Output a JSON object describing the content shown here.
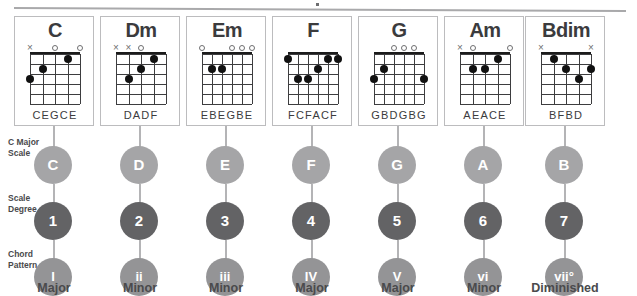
{
  "diagram": {
    "row_labels": {
      "scale": "C Major Scale",
      "degree": "Scale Degree",
      "pattern": "Chord Pattern"
    }
  },
  "chart_data": {
    "type": "table",
    "columns": [
      "Chord",
      "String Notes",
      "Scale Note",
      "Scale Degree",
      "Chord Pattern",
      "Quality"
    ],
    "rows": [
      [
        "C",
        "CEGCE",
        "C",
        "1",
        "I",
        "Major"
      ],
      [
        "Dm",
        "DADF",
        "D",
        "2",
        "ii",
        "Minor"
      ],
      [
        "Em",
        "EBEGBE",
        "E",
        "3",
        "iii",
        "Minor"
      ],
      [
        "F",
        "FCFACF",
        "F",
        "4",
        "IV",
        "Major"
      ],
      [
        "G",
        "GBDGBG",
        "G",
        "5",
        "V",
        "Major"
      ],
      [
        "Am",
        "AEACE",
        "A",
        "6",
        "vi",
        "Minor"
      ],
      [
        "Bdim",
        "BFBD",
        "B",
        "7",
        "vii°",
        "Diminished"
      ]
    ],
    "colors": {
      "scale_circle": "#a5a5a7",
      "degree_circle": "#636365",
      "pattern_circle": "#949496",
      "text": "#58585a",
      "grid": "#3d3d3f",
      "dot": "#111111"
    }
  },
  "chords": [
    {
      "name": "C",
      "string_notes": "CEGCE",
      "strings": 5,
      "frets": 5,
      "markers": [
        "x",
        "",
        "o",
        "",
        "o"
      ],
      "dots": [
        {
          "string": 1,
          "fret": 3
        },
        {
          "string": 2,
          "fret": 2
        },
        {
          "string": 4,
          "fret": 1
        }
      ],
      "scale_note": "C",
      "degree": "1",
      "pattern": "I",
      "quality": "Major"
    },
    {
      "name": "Dm",
      "string_notes": "DADF",
      "strings": 5,
      "frets": 5,
      "markers": [
        "x",
        "x",
        "o",
        "",
        ""
      ],
      "dots": [
        {
          "string": 4,
          "fret": 1
        },
        {
          "string": 3,
          "fret": 2
        },
        {
          "string": 2,
          "fret": 3
        }
      ],
      "scale_note": "D",
      "degree": "2",
      "pattern": "ii",
      "quality": "Minor"
    },
    {
      "name": "Em",
      "string_notes": "EBEGBE",
      "strings": 6,
      "frets": 5,
      "markers": [
        "o",
        "",
        "",
        "o",
        "o",
        "o"
      ],
      "dots": [
        {
          "string": 2,
          "fret": 2
        },
        {
          "string": 3,
          "fret": 2
        }
      ],
      "scale_note": "E",
      "degree": "3",
      "pattern": "iii",
      "quality": "Minor"
    },
    {
      "name": "F",
      "string_notes": "FCFACF",
      "strings": 6,
      "frets": 5,
      "markers": [
        "",
        "",
        "",
        "",
        "",
        ""
      ],
      "dots": [
        {
          "string": 1,
          "fret": 1
        },
        {
          "string": 5,
          "fret": 1
        },
        {
          "string": 6,
          "fret": 1
        },
        {
          "string": 4,
          "fret": 2
        },
        {
          "string": 2,
          "fret": 3
        },
        {
          "string": 3,
          "fret": 3
        }
      ],
      "scale_note": "F",
      "degree": "4",
      "pattern": "IV",
      "quality": "Major"
    },
    {
      "name": "G",
      "string_notes": "GBDGBG",
      "strings": 6,
      "frets": 5,
      "markers": [
        "",
        "",
        "o",
        "o",
        "o",
        ""
      ],
      "dots": [
        {
          "string": 2,
          "fret": 2
        },
        {
          "string": 1,
          "fret": 3
        },
        {
          "string": 6,
          "fret": 3
        }
      ],
      "scale_note": "G",
      "degree": "5",
      "pattern": "V",
      "quality": "Major"
    },
    {
      "name": "Am",
      "string_notes": "AEACE",
      "strings": 5,
      "frets": 5,
      "markers": [
        "x",
        "o",
        "",
        "",
        "o"
      ],
      "dots": [
        {
          "string": 4,
          "fret": 1
        },
        {
          "string": 2,
          "fret": 2
        },
        {
          "string": 3,
          "fret": 2
        }
      ],
      "scale_note": "A",
      "degree": "6",
      "pattern": "vi",
      "quality": "Minor"
    },
    {
      "name": "Bdim",
      "string_notes": "BFBD",
      "strings": 5,
      "frets": 5,
      "markers": [
        "x",
        "",
        "",
        "",
        "x"
      ],
      "dots": [
        {
          "string": 2,
          "fret": 1
        },
        {
          "string": 3,
          "fret": 2
        },
        {
          "string": 5,
          "fret": 2
        },
        {
          "string": 4,
          "fret": 3
        }
      ],
      "scale_note": "B",
      "degree": "7",
      "pattern": "vii°",
      "quality": "Diminished"
    }
  ]
}
